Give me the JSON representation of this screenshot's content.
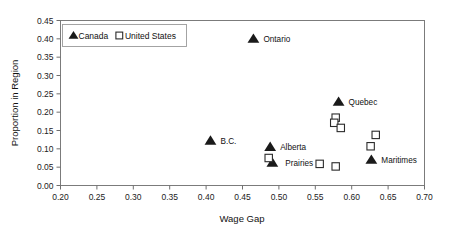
{
  "chart_data": {
    "type": "scatter",
    "title": "",
    "xlabel": "Wage Gap",
    "ylabel": "Proportion in Region",
    "xlim": [
      0.2,
      0.7
    ],
    "ylim": [
      0.0,
      0.45
    ],
    "xticks": [
      "0.20",
      "0.25",
      "0.30",
      "0.35",
      "0.40",
      "0.45",
      "0.50",
      "0.55",
      "0.60",
      "0.65",
      "0.70"
    ],
    "xtick_values": [
      0.2,
      0.25,
      0.3,
      0.35,
      0.4,
      0.45,
      0.5,
      0.55,
      0.6,
      0.65,
      0.7
    ],
    "yticks": [
      "0.00",
      "0.05",
      "0.10",
      "0.15",
      "0.20",
      "0.25",
      "0.30",
      "0.35",
      "0.40",
      "0.45"
    ],
    "ytick_values": [
      0.0,
      0.05,
      0.1,
      0.15,
      0.2,
      0.25,
      0.3,
      0.35,
      0.4,
      0.45
    ],
    "grid": false,
    "legend_position": "top-left",
    "series": [
      {
        "name": "Canada",
        "marker": "filled-triangle",
        "color": "#1a1a1a",
        "points": [
          {
            "label": "Ontario",
            "x": 0.465,
            "y": 0.4,
            "label_dx": 10,
            "label_dy": 3
          },
          {
            "label": "Quebec",
            "x": 0.582,
            "y": 0.228,
            "label_dx": 10,
            "label_dy": 3
          },
          {
            "label": "B.C.",
            "x": 0.406,
            "y": 0.122,
            "label_dx": 10,
            "label_dy": 3
          },
          {
            "label": "Alberta",
            "x": 0.488,
            "y": 0.105,
            "label_dx": 10,
            "label_dy": 3
          },
          {
            "label": "Prairies",
            "x": 0.491,
            "y": 0.062,
            "label_dx": 13,
            "label_dy": 3
          },
          {
            "label": "Maritimes",
            "x": 0.627,
            "y": 0.07,
            "label_dx": 10,
            "label_dy": 3
          }
        ]
      },
      {
        "name": "United States",
        "marker": "open-square",
        "color": "#2b2b2b",
        "points": [
          {
            "label": "",
            "x": 0.578,
            "y": 0.185
          },
          {
            "label": "",
            "x": 0.576,
            "y": 0.171
          },
          {
            "label": "",
            "x": 0.585,
            "y": 0.157
          },
          {
            "label": "",
            "x": 0.633,
            "y": 0.138
          },
          {
            "label": "",
            "x": 0.626,
            "y": 0.107
          },
          {
            "label": "",
            "x": 0.486,
            "y": 0.075
          },
          {
            "label": "",
            "x": 0.556,
            "y": 0.059
          },
          {
            "label": "",
            "x": 0.578,
            "y": 0.052
          }
        ]
      }
    ]
  },
  "legend": {
    "entries": [
      {
        "label": "Canada",
        "marker": "filled-triangle"
      },
      {
        "label": "United States",
        "marker": "open-square"
      }
    ]
  },
  "axes": {
    "x_title": "Wage Gap",
    "y_title": "Proportion in Region"
  }
}
